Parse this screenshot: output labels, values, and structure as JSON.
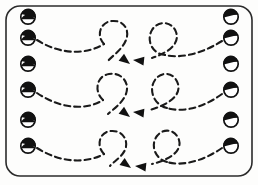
{
  "diagram": {
    "background_color": "#fdfdfc",
    "ink_color": "#1a1a1a",
    "frame": {
      "name": "rounded-court-border",
      "x": 6,
      "y": 6,
      "width": 246,
      "height": 170,
      "corner_radius": 14,
      "stroke_color": "#2b2b2b",
      "stroke_width": 1.6
    },
    "style": {
      "path_dash": "6 4",
      "path_stroke_width": 2.1,
      "marker_radius": 7.2,
      "marker_fill": "#ffffff",
      "marker_cap_fill": "#111111"
    },
    "left_markers": [
      {
        "label": "L1",
        "cx": 28,
        "cy": 17,
        "cap": "right"
      },
      {
        "label": "L2",
        "cx": 28,
        "cy": 38,
        "cap": "right"
      },
      {
        "label": "L3",
        "cx": 28,
        "cy": 64,
        "cap": "right"
      },
      {
        "label": "L4",
        "cx": 28,
        "cy": 90,
        "cap": "right"
      },
      {
        "label": "L5",
        "cx": 28,
        "cy": 120,
        "cap": "right"
      },
      {
        "label": "L6",
        "cx": 28,
        "cy": 146,
        "cap": "right"
      }
    ],
    "right_markers": [
      {
        "label": "R1",
        "cx": 231,
        "cy": 17,
        "cap": "left"
      },
      {
        "label": "R2",
        "cx": 231,
        "cy": 38,
        "cap": "left"
      },
      {
        "label": "R3",
        "cx": 231,
        "cy": 64,
        "cap": "left"
      },
      {
        "label": "R4",
        "cx": 231,
        "cy": 90,
        "cap": "left"
      },
      {
        "label": "R5",
        "cx": 231,
        "cy": 120,
        "cap": "left"
      },
      {
        "label": "R6",
        "cx": 231,
        "cy": 146,
        "cap": "left"
      }
    ],
    "rows": [
      {
        "label": "row-1",
        "left_path": "M 37 40 C 62 56, 88 54, 104 44",
        "left_loop": "M 104 44 C 96 36, 100 22, 112 21 C 124 20, 130 30, 126 40 C 122 50, 112 56, 108 61",
        "left_arrow": {
          "x": 130,
          "y": 64,
          "angle": 38
        },
        "right_path": "M 222 41 C 198 56, 178 58, 165 55",
        "right_loop": "M 165 55 C 152 54, 146 40, 152 30 C 158 20, 172 21, 176 32 C 180 43, 170 52, 152 58",
        "right_arrow": {
          "x": 133,
          "y": 60,
          "angle": 186
        }
      },
      {
        "label": "row-2",
        "left_path": "M 37 93 C 62 110, 88 110, 103 100",
        "left_loop": "M 103 100 C 94 92, 96 76, 109 74 C 122 72, 130 83, 126 94 C 122 104, 112 110, 108 114",
        "left_arrow": {
          "x": 130,
          "y": 117,
          "angle": 38
        },
        "right_path": "M 222 94 C 200 110, 180 112, 167 108",
        "right_loop": "M 167 108 C 154 105, 148 90, 155 80 C 162 70, 175 73, 178 84 C 181 95, 170 104, 150 110",
        "right_arrow": {
          "x": 133,
          "y": 112,
          "angle": 186
        }
      },
      {
        "label": "row-3",
        "left_path": "M 37 148 C 62 164, 88 163, 104 154",
        "left_loop": "M 104 154 C 96 146, 99 132, 111 131 C 123 130, 129 141, 125 150 C 121 158, 113 162, 110 166",
        "left_arrow": {
          "x": 131,
          "y": 168,
          "angle": 36
        },
        "right_path": "M 222 148 C 200 163, 180 166, 167 162",
        "right_loop": "M 167 162 C 155 159, 150 145, 157 136 C 164 127, 176 130, 179 140 C 182 150, 172 159, 152 164",
        "right_arrow": {
          "x": 135,
          "y": 166,
          "angle": 186
        }
      }
    ]
  }
}
